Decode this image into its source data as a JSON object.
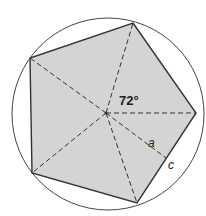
{
  "diagram": {
    "labels": {
      "angle": "72°",
      "apothem": "a",
      "half_side": "c"
    },
    "colors": {
      "fill": "#d4d4d4",
      "stroke": "#333333",
      "background": "#ffffff"
    }
  }
}
